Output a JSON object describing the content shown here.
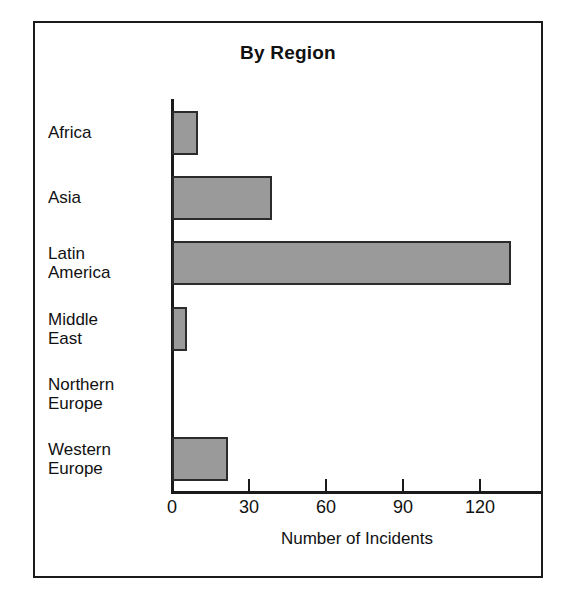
{
  "figure": {
    "title": "By Region",
    "border_color": "#1a1a1a",
    "background": "#ffffff"
  },
  "chart_data": {
    "type": "bar",
    "orientation": "horizontal",
    "title": "By Region",
    "xlabel": "Number of Incidents",
    "ylabel": "",
    "categories": [
      "Africa",
      "Asia",
      "Latin America",
      "Middle East",
      "Northern Europe",
      "Western Europe"
    ],
    "values": [
      10,
      39,
      132,
      6,
      0,
      22
    ],
    "xlim": [
      0,
      143
    ],
    "xticks": [
      0,
      30,
      60,
      90,
      120
    ],
    "xticklabels": [
      "0",
      "30",
      "60",
      "90",
      "120"
    ],
    "grid": false,
    "legend": false,
    "bar_fill_color": "#9a9a9a",
    "bar_edge_color": "#2b2b2b"
  },
  "axis": {
    "x_title": "Number of Incidents",
    "ticks": [
      {
        "label": "0",
        "value": 0
      },
      {
        "label": "30",
        "value": 30
      },
      {
        "label": "60",
        "value": 60
      },
      {
        "label": "90",
        "value": 90
      },
      {
        "label": "120",
        "value": 120
      }
    ]
  },
  "categories": [
    {
      "name": "Africa",
      "lines": [
        "Africa"
      ],
      "value": 10
    },
    {
      "name": "Asia",
      "lines": [
        "Asia"
      ],
      "value": 39
    },
    {
      "name": "Latin America",
      "lines": [
        "Latin",
        "America"
      ],
      "value": 132
    },
    {
      "name": "Middle East",
      "lines": [
        "Middle",
        "East"
      ],
      "value": 6
    },
    {
      "name": "Northern Europe",
      "lines": [
        "Northern",
        "Europe"
      ],
      "value": 0
    },
    {
      "name": "Western Europe",
      "lines": [
        "Western",
        "Europe"
      ],
      "value": 22
    }
  ]
}
